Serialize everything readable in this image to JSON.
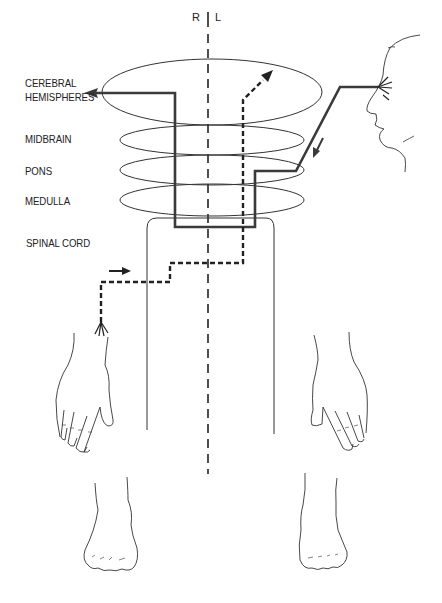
{
  "diagram": {
    "labels": {
      "cerebral_hemispheres_line1": "CEREBRAL",
      "cerebral_hemispheres_line2": "HEMISPHERES",
      "midbrain": "MIDBRAIN",
      "pons": "PONS",
      "medulla": "MEDULLA",
      "spinal_cord": "SPINAL CORD"
    },
    "sides": {
      "right": "R",
      "left": "L"
    },
    "pathways": [
      {
        "name": "visual-pathway",
        "style": "solid",
        "from": "eye",
        "to": "right cerebral hemisphere"
      },
      {
        "name": "somatosensory-pathway",
        "style": "dashed",
        "from": "right hand",
        "to": "left cerebral hemisphere"
      }
    ],
    "colors": {
      "line": "#222222",
      "pathway": "#3a3a3a",
      "background": "#ffffff"
    }
  }
}
